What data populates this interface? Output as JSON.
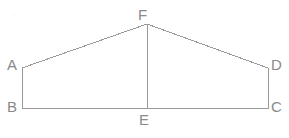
{
  "figure": {
    "background_color": "#ffffff",
    "stroke_color": "#9a9a9a",
    "label_color": "#8a8a8a",
    "stroke_width": 1,
    "labels": {
      "A": "A",
      "B": "B",
      "C": "C",
      "D": "D",
      "E": "E",
      "F": "F"
    },
    "points": {
      "A": {
        "x": 22,
        "y": 68
      },
      "B": {
        "x": 22,
        "y": 108
      },
      "C": {
        "x": 268,
        "y": 108
      },
      "D": {
        "x": 268,
        "y": 68
      },
      "E": {
        "x": 147,
        "y": 108
      },
      "F": {
        "x": 147,
        "y": 24
      }
    },
    "segments": [
      {
        "name": "AF",
        "from": "A",
        "to": "F"
      },
      {
        "name": "FD",
        "from": "F",
        "to": "D"
      },
      {
        "name": "AB",
        "from": "A",
        "to": "B"
      },
      {
        "name": "DC",
        "from": "D",
        "to": "C"
      },
      {
        "name": "BC",
        "from": "B",
        "to": "C"
      },
      {
        "name": "FE",
        "from": "F",
        "to": "E"
      }
    ]
  }
}
